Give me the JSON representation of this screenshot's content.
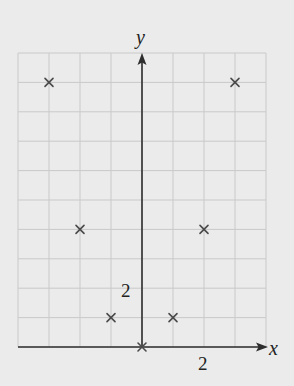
{
  "chart_data": {
    "type": "scatter",
    "title": "",
    "xlabel": "x",
    "ylabel": "y",
    "xlim": [
      -4,
      4
    ],
    "ylim": [
      0,
      10
    ],
    "grid": true,
    "legend": null,
    "tick_labels": {
      "x": [
        {
          "value": 2,
          "label": "2"
        }
      ],
      "y": [
        {
          "value": 2,
          "label": "2"
        }
      ]
    },
    "marker": "x",
    "series": [
      {
        "name": "points",
        "x": [
          -3,
          -2,
          -1,
          0,
          1,
          2,
          3
        ],
        "y": [
          9,
          4,
          1,
          0,
          1,
          4,
          9
        ]
      }
    ]
  },
  "colors": {
    "background": "#ebebeb",
    "grid": "#c9c9c9",
    "axes": "#2e2e2e",
    "marker": "#4a4a4a"
  }
}
